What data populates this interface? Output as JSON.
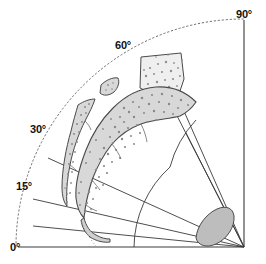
{
  "figure": {
    "background_color": "#ffffff",
    "width": 266,
    "height": 264,
    "origin": {
      "x": 244,
      "y": 247
    },
    "outer_radius": 228,
    "line_color": "#333333",
    "axis_color": "#555555",
    "fill_color": "#d2d2d2",
    "fill_color_light": "#ececec",
    "stipple_color": "#8a8a8a"
  },
  "axes": {
    "x_axis": {
      "name": "horizontal-baseline",
      "x1": 18,
      "y1": 247,
      "x2": 244,
      "y2": 247
    },
    "y_axis": {
      "name": "vertical-right-axis",
      "x1": 244,
      "y1": 20,
      "x2": 244,
      "y2": 247
    },
    "outer_arc": {
      "name": "dotted-outer-arc",
      "style": "dotted",
      "radius": 228
    },
    "inner_arc": {
      "name": "inner-solid-arc",
      "style": "solid",
      "radius": 110
    }
  },
  "angle_labels": [
    {
      "id": "tick-0",
      "text": "0°",
      "value": 0,
      "x": 10,
      "y": 251
    },
    {
      "id": "tick-15",
      "text": "15°",
      "value": 15,
      "x": 16,
      "y": 190
    },
    {
      "id": "tick-30",
      "text": "30°",
      "value": 30,
      "x": 30,
      "y": 133
    },
    {
      "id": "tick-60",
      "text": "60°",
      "value": 60,
      "x": 115,
      "y": 49
    },
    {
      "id": "tick-90",
      "text": "90°",
      "value": 90,
      "x": 238,
      "y": 18
    }
  ],
  "radial_lines": [
    {
      "id": "radial-15",
      "angle": 15,
      "x1": 33,
      "y1": 199,
      "x2": 244,
      "y2": 247
    },
    {
      "id": "radial-22",
      "angle": 22,
      "x1": 33,
      "y1": 226,
      "x2": 244,
      "y2": 247
    },
    {
      "id": "radial-30",
      "angle": 30,
      "x1": 48,
      "y1": 158,
      "x2": 244,
      "y2": 247
    },
    {
      "id": "radial-45",
      "angle": 45,
      "x1": 186,
      "y1": 133,
      "x2": 244,
      "y2": 247
    },
    {
      "id": "radial-60",
      "angle": 60,
      "x1": 147,
      "y1": 57,
      "x2": 244,
      "y2": 247
    },
    {
      "id": "radial-65",
      "angle": 65,
      "x1": 168,
      "y1": 75,
      "x2": 244,
      "y2": 247
    }
  ],
  "regions": [
    {
      "id": "region-upper-right-patch",
      "name": "upper-right-stipple-patch",
      "label": "",
      "fill": "#eeeeee",
      "path": "M141,57 L181,53 L184,79 L176,103 L161,98 L140,88 Z",
      "stipple_count": 26
    },
    {
      "id": "region-main-band",
      "name": "main-curved-band",
      "label": "",
      "fill": "#d8d8d8",
      "path": "M113,108 C126,95 142,88 156,87 C172,86 186,92 196,102 C192,108 186,113 180,116 C168,119 152,120 141,124 C130,128 120,135 112,144 C104,154 97,167 92,180 C88,193 85,207 84,218 C80,214 77,207 76,198 C75,185 79,168 86,150 C93,132 103,118 113,108 Z",
      "stipple_count": 60
    },
    {
      "id": "region-left-sliver",
      "name": "left-thin-sliver",
      "label": "",
      "fill": "#d8d8d8",
      "path": "M78,105 C84,101 90,99 95,99 C93,106 89,113 85,121 C79,133 73,149 70,165 C67,180 66,194 67,206 C64,203 62,196 62,187 C62,170 66,148 71,131 C73,122 76,112 78,105 Z",
      "stipple_count": 22
    },
    {
      "id": "region-small-blob",
      "name": "small-isolated-blob",
      "label": "",
      "fill": "#d8d8d8",
      "path": "M101,85 C106,80 113,77 118,78 C120,82 118,88 114,92 C109,96 103,96 100,93 Z",
      "stipple_count": 4
    },
    {
      "id": "region-tail",
      "name": "lower-tail-hook",
      "label": "",
      "fill": "#cfcfcf",
      "path": "M84,218 C86,226 90,232 96,235 C101,238 106,239 110,239 L110,242 C104,243 96,241 90,237 C85,233 82,227 81,220 Z",
      "stipple_count": 0
    },
    {
      "id": "region-apex-ellipse",
      "name": "apex-gray-ellipse",
      "label": "",
      "fill": "#bdbdbd",
      "path": "M196,238 C197,226 206,214 217,209 C226,205 233,208 234,216 C235,227 227,239 216,244 C207,248 198,246 196,238 Z",
      "stipple_count": 0
    }
  ],
  "internal_dividers": [
    {
      "id": "divider-band-1",
      "path": "M141,124 C144,129 146,135 147,141"
    },
    {
      "id": "divider-band-2",
      "path": "M112,144 C116,148 119,153 121,158"
    },
    {
      "id": "divider-band-3",
      "path": "M92,180 C95,183 98,186 100,189"
    },
    {
      "id": "divider-sliver-1",
      "path": "M85,121 C88,123 90,126 91,129"
    },
    {
      "id": "divider-sliver-2",
      "path": "M70,165 C73,167 76,169 78,171"
    }
  ],
  "dotted_guides": [
    {
      "id": "dotted-tail-guide",
      "path": "M82,222 C85,230 90,238 96,245"
    }
  ]
}
